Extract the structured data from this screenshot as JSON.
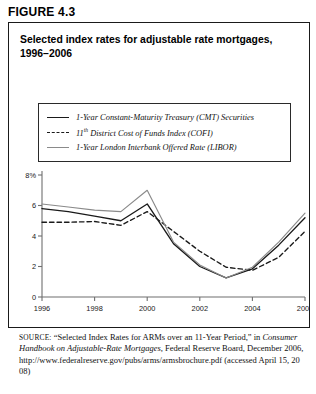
{
  "figure": {
    "label": "FIGURE 4.3",
    "title_line1": "Selected index rates for adjustable rate mortgages,",
    "title_line2": "1996–2006"
  },
  "legend": {
    "position": "inside-top",
    "items": [
      {
        "label": "1-Year Constant-Maturity Treasury (CMT) Securities",
        "style": "solid",
        "color": "#1a1a1a",
        "name": "cmt"
      },
      {
        "label_prefix": "11",
        "label_sup": "th",
        "label_rest": " District Cost of Funds Index (COFI)",
        "label": "11th District Cost of Funds Index (COFI)",
        "style": "dashed",
        "color": "#1a1a1a",
        "name": "cofi"
      },
      {
        "label": "1-Year London Interbank Offered Rate (LIBOR)",
        "style": "solid",
        "color": "#8a8a8a",
        "name": "libor"
      }
    ]
  },
  "axes": {
    "y_top_label": "8%",
    "y_ticks": [
      "8%",
      "6",
      "4",
      "2",
      "0"
    ],
    "y_tick_values": [
      8,
      6,
      4,
      2,
      0
    ],
    "x_ticks": [
      "1996",
      "1998",
      "2000",
      "2002",
      "2004",
      "2006"
    ],
    "x_tick_values": [
      1996,
      1998,
      2000,
      2002,
      2004,
      2006
    ]
  },
  "source": {
    "prefix": "SOURCE:",
    "text_part1": " “Selected Index Rates for ARMs over an 11-Year Period,” in ",
    "italic_title": "Consumer Handbook on Adjustable-Rate Mortgages",
    "text_part2": ", Federal Reserve Board, December 2006, http://www.federalreserve.gov/pubs/arms/armsbrochure.pdf (accessed April 15, 2008)"
  },
  "chart_data": {
    "type": "line",
    "title": "Selected index rates for adjustable rate mortgages, 1996–2006",
    "xlabel": "",
    "ylabel": "",
    "ylim": [
      0,
      8
    ],
    "xlim": [
      1996,
      2006
    ],
    "grid": false,
    "legend_position": "upper-left-inside",
    "x": [
      1996,
      1997,
      1998,
      1999,
      2000,
      2001,
      2002,
      2003,
      2004,
      2005,
      2006
    ],
    "series": [
      {
        "name": "1-Year Constant-Maturity Treasury (CMT) Securities",
        "short": "CMT",
        "style": "solid",
        "color": "#1a1a1a",
        "values": [
          5.8,
          5.6,
          5.3,
          5.0,
          6.1,
          3.5,
          2.0,
          1.25,
          1.85,
          3.4,
          5.2
        ]
      },
      {
        "name": "11th District Cost of Funds Index (COFI)",
        "short": "COFI",
        "style": "dashed",
        "color": "#1a1a1a",
        "values": [
          4.9,
          4.9,
          4.95,
          4.7,
          5.6,
          4.3,
          3.0,
          1.95,
          1.75,
          2.6,
          4.3
        ]
      },
      {
        "name": "1-Year London Interbank Offered Rate (LIBOR)",
        "short": "LIBOR",
        "style": "solid",
        "color": "#8a8a8a",
        "values": [
          6.1,
          5.9,
          5.7,
          5.6,
          7.0,
          3.6,
          2.1,
          1.25,
          1.95,
          3.6,
          5.5
        ]
      }
    ]
  }
}
